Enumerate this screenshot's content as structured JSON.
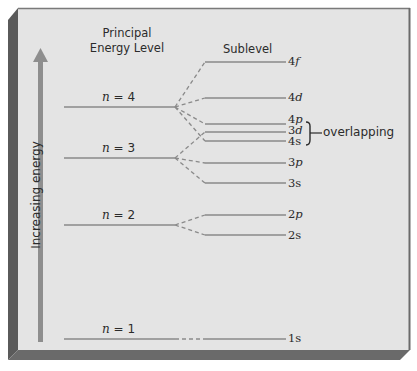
{
  "diagram": {
    "headers": {
      "principal": [
        "Principal",
        "Energy Level"
      ],
      "sublevel": "Sublevel"
    },
    "axis_label": "Increasing energy",
    "principal_levels": [
      {
        "n": "4",
        "label_prefix": "n",
        "label": "n = 4",
        "value": "= 4",
        "y": 107
      },
      {
        "n": "3",
        "label_prefix": "n",
        "label": "n = 3",
        "value": "= 3",
        "y": 158
      },
      {
        "n": "2",
        "label_prefix": "n",
        "label": "n = 2",
        "value": "= 2",
        "y": 225
      },
      {
        "n": "1",
        "label_prefix": "n",
        "label": "n = 1",
        "value": "= 1",
        "y": 339
      }
    ],
    "sublevels": [
      {
        "name": "4f",
        "num": "4",
        "letter": "f",
        "parent": "4",
        "y": 62
      },
      {
        "name": "4d",
        "num": "4",
        "letter": "d",
        "parent": "4",
        "y": 98
      },
      {
        "name": "4p",
        "num": "4",
        "letter": "p",
        "parent": "4",
        "y": 124
      },
      {
        "name": "3d",
        "num": "3",
        "letter": "d",
        "parent": "3",
        "y": 132
      },
      {
        "name": "4s",
        "num": "4",
        "letter": "s",
        "parent": "4",
        "y": 141
      },
      {
        "name": "3p",
        "num": "3",
        "letter": "p",
        "parent": "3",
        "y": 163
      },
      {
        "name": "3s",
        "num": "3",
        "letter": "s",
        "parent": "3",
        "y": 183
      },
      {
        "name": "2p",
        "num": "2",
        "letter": "p",
        "parent": "2",
        "y": 215
      },
      {
        "name": "2s",
        "num": "2",
        "letter": "s",
        "parent": "2",
        "y": 235
      },
      {
        "name": "1s",
        "num": "1",
        "letter": "s",
        "parent": "1",
        "y": 339
      }
    ],
    "annotation": {
      "text": "overlapping",
      "targets": [
        "4p",
        "3d",
        "4s"
      ]
    },
    "colors": {
      "panel": "#e4e4e4",
      "frame_dark": "#5a5a5a",
      "frame_mid": "#7a7a7a",
      "line": "#8a8a8a",
      "arrow": "#8e8e8e",
      "text": "#2b2b2b"
    }
  }
}
